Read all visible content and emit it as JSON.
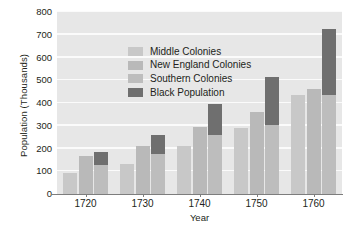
{
  "chart_data": {
    "type": "bar",
    "title": "",
    "xlabel": "Year",
    "ylabel": "Population (Thousands)",
    "categories": [
      "1720",
      "1730",
      "1740",
      "1750",
      "1760"
    ],
    "ylim": [
      0,
      800
    ],
    "ytick_values": [
      0,
      100,
      200,
      300,
      400,
      500,
      600,
      700,
      800
    ],
    "ytick_labels": [
      "0",
      "100",
      "200",
      "300",
      "400",
      "500",
      "600",
      "700",
      "800"
    ],
    "grid": true,
    "legend_position": "upper-left-inside",
    "note": "Each year shows three cumulative bars; the third bar carries a dark Black Population segment on top.",
    "series": [
      {
        "name": "Middle Colonies",
        "color": "#c8c8c8",
        "values": [
          93,
          133,
          212,
          289,
          434
        ]
      },
      {
        "name": "New England Colonies",
        "color": "#b9b9b9",
        "values": [
          165,
          211,
          296,
          360,
          461
        ]
      },
      {
        "name": "Southern Colonies",
        "color": "#bdbdbd",
        "values": [
          128,
          178,
          261,
          304,
          434
        ]
      },
      {
        "name": "Black Population",
        "color": "#6f6f6f",
        "values": [
          184,
          259,
          397,
          514,
          726
        ]
      }
    ],
    "bars": [
      {
        "category": "1720",
        "bar1_top": 93,
        "bar2_top": 165,
        "bar3_base": 128,
        "bar3_top": 184
      },
      {
        "category": "1730",
        "bar1_top": 133,
        "bar2_top": 211,
        "bar3_base": 178,
        "bar3_top": 259
      },
      {
        "category": "1740",
        "bar1_top": 212,
        "bar2_top": 296,
        "bar3_base": 261,
        "bar3_top": 397
      },
      {
        "category": "1750",
        "bar1_top": 289,
        "bar2_top": 360,
        "bar3_base": 304,
        "bar3_top": 514
      },
      {
        "category": "1760",
        "bar1_top": 434,
        "bar2_top": 461,
        "bar3_base": 434,
        "bar3_top": 726
      }
    ]
  },
  "legend": {
    "items": [
      {
        "label": "Middle Colonies"
      },
      {
        "label": "New England Colonies"
      },
      {
        "label": "Southern Colonies"
      },
      {
        "label": "Black Population"
      }
    ]
  },
  "colors": {
    "plot_background": "#e7e7e7",
    "gridline": "#fbfbfb",
    "axis": "#7d7d7d",
    "text": "#231f20",
    "series_light": "#c8c8c8",
    "series_mid": "#b9b9b9",
    "series_dark": "#6f6f6f"
  }
}
